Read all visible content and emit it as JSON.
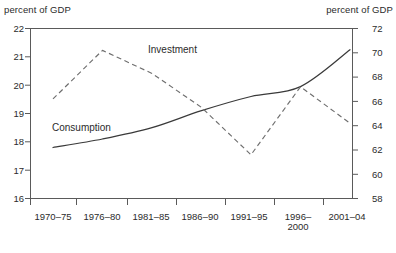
{
  "chart_data": {
    "type": "line",
    "title": "",
    "categories": [
      "1970–75",
      "1976–80",
      "1981–85",
      "1986–90",
      "1991–95",
      "1996–2000",
      "2001–04"
    ],
    "series": [
      {
        "name": "Consumption",
        "axis": "left",
        "style": "solid",
        "values": [
          17.8,
          18.1,
          18.5,
          19.1,
          19.6,
          19.95,
          21.25
        ]
      },
      {
        "name": "Investment",
        "axis": "right",
        "style": "dashed",
        "values": [
          66.2,
          70.2,
          68.3,
          65.5,
          61.6,
          67.2,
          64.2
        ]
      }
    ],
    "left_axis": {
      "label": "percent of GDP",
      "ticks": [
        16,
        17,
        18,
        19,
        20,
        21,
        22
      ],
      "ylim": [
        16,
        22
      ]
    },
    "right_axis": {
      "label": "percent of GDP",
      "ticks": [
        58,
        60,
        62,
        64,
        66,
        68,
        70,
        72
      ],
      "ylim": [
        58,
        72
      ]
    },
    "xlabel": "",
    "grid": false,
    "legend": "inline-annotations",
    "colors": {
      "consumption_line": "#3a3a3a",
      "investment_line": "#666666",
      "axis": "#555555",
      "text": "#2b2b2b"
    }
  },
  "labels": {
    "left_axis_title": "percent of GDP",
    "right_axis_title": "percent of GDP",
    "series_investment": "Investment",
    "series_consumption": "Consumption",
    "y_left": {
      "t22": "22",
      "t21": "21",
      "t20": "20",
      "t19": "19",
      "t18": "18",
      "t17": "17",
      "t16": "16"
    },
    "y_right": {
      "t72": "72",
      "t70": "70",
      "t68": "68",
      "t66": "66",
      "t64": "64",
      "t62": "62",
      "t60": "60",
      "t58": "58"
    },
    "x": {
      "c0": "1970–75",
      "c1": "1976–80",
      "c2": "1981–85",
      "c3": "1986–90",
      "c4": "1991–95",
      "c5a": "1996–",
      "c5b": "2000",
      "c6": "2001–04"
    }
  }
}
